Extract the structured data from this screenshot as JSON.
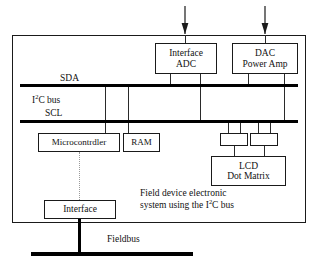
{
  "diagram": {
    "title_caption_line1": "Field device electronic",
    "title_caption_line2_pre": "system using the I",
    "title_caption_line2_sup": "2",
    "title_caption_line2_post": "C bus",
    "bus_labels": {
      "sda": "SDA",
      "i2c_pre": "I",
      "i2c_sup": "2",
      "i2c_post": "C bus",
      "scl": "SCL"
    },
    "fieldbus_label": "Fieldbus",
    "blocks": {
      "interface_adc_line1": "Interface",
      "interface_adc_line2": "ADC",
      "dac_line1": "DAC",
      "dac_line2": "Power Amp",
      "microcontroller": "Microcontrdler",
      "ram": "RAM",
      "lcd_line1": "LCD",
      "lcd_line2": "Dot Matrix",
      "interface_fieldbus": "Interface",
      "lcd_driver_left": "",
      "lcd_driver_right": ""
    },
    "colors": {
      "line": "#1a1a1a",
      "bus": "#000000",
      "background": "#ffffff",
      "dotted": "#9a9a9a"
    }
  }
}
